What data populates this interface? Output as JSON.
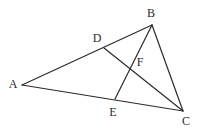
{
  "figure": {
    "kind": "geometry-diagram",
    "background_color": "#ffffff",
    "stroke_color": "#2b2b2b",
    "label_color": "#2b2b2b",
    "stroke_width": 1.2,
    "canvas": {
      "width": 200,
      "height": 132
    },
    "points": [
      {
        "id": "A",
        "label": "A",
        "x": 22,
        "y": 85,
        "label_x": 13,
        "label_y": 84,
        "on": "triangle-vertex"
      },
      {
        "id": "B",
        "label": "B",
        "x": 152,
        "y": 25,
        "label_x": 151,
        "label_y": 13,
        "on": "triangle-vertex"
      },
      {
        "id": "C",
        "label": "C",
        "x": 183,
        "y": 111,
        "label_x": 186,
        "label_y": 121,
        "on": "triangle-vertex"
      },
      {
        "id": "D",
        "label": "D",
        "x": 104,
        "y": 48,
        "label_x": 97,
        "label_y": 38,
        "on": "segment-AB"
      },
      {
        "id": "E",
        "label": "E",
        "x": 115,
        "y": 99,
        "label_x": 113,
        "label_y": 112,
        "on": "segment-AC"
      },
      {
        "id": "F",
        "label": "F",
        "x": 130,
        "y": 63,
        "label_x": 140,
        "label_y": 62,
        "on": "intersection-DC-EB"
      }
    ],
    "segments": [
      {
        "id": "AB",
        "from": "A",
        "to": "B",
        "name": "side-ab"
      },
      {
        "id": "AC",
        "from": "A",
        "to": "C",
        "name": "side-ac"
      },
      {
        "id": "BC",
        "from": "B",
        "to": "C",
        "name": "side-bc"
      },
      {
        "id": "DC",
        "from": "D",
        "to": "C",
        "name": "cevian-dc"
      },
      {
        "id": "EB",
        "from": "E",
        "to": "B",
        "name": "cevian-eb"
      }
    ]
  }
}
